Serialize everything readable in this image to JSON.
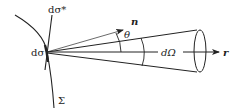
{
  "diagram": {
    "type": "solid-angle-geometry",
    "labels": {
      "surface_element": "dσ",
      "projected_element": "dσ*",
      "surface": "Σ",
      "normal": "n",
      "angle": "θ",
      "solid_angle": "dΩ",
      "direction": "r"
    },
    "colors": {
      "stroke": "#222222",
      "background": "#ffffff"
    }
  }
}
